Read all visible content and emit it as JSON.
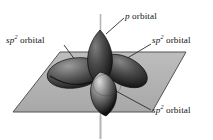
{
  "figure": {
    "background_color": "#ffffff",
    "plane": {
      "name": "trigonal plane",
      "fill_color": "#b3b3b3",
      "edge_color": "#4d4d4d"
    },
    "axis": {
      "name": "vertical axis",
      "color": "#b5b5b5"
    },
    "labels": {
      "p_orbital": {
        "prefix": "p",
        "suffix": " orbital"
      },
      "sp2_orbital_left": {
        "prefix": "sp",
        "sup": "2",
        "suffix": " orbital"
      },
      "sp2_orbital_right": {
        "prefix": "sp",
        "sup": "2",
        "suffix": " orbital"
      },
      "sp2_orbital_bottom": {
        "prefix": "sp",
        "sup": "2",
        "suffix": " orbital"
      }
    },
    "lobes": [
      {
        "name": "p-orbital-lobe-up",
        "type": "p",
        "direction": "up",
        "fill_dark": "#2a2a2a",
        "fill_light": "#6f6f6f"
      },
      {
        "name": "sp2-lobe-left",
        "type": "sp2",
        "direction": "left-back",
        "fill_dark": "#2e2e2e",
        "fill_light": "#8a8a8a"
      },
      {
        "name": "sp2-lobe-right",
        "type": "sp2",
        "direction": "right-back",
        "fill_dark": "#262626",
        "fill_light": "#777777"
      },
      {
        "name": "sp2-lobe-front",
        "type": "sp2",
        "direction": "front-down",
        "fill_dark": "#1f1f1f",
        "fill_light": "#c9c9c9"
      }
    ]
  }
}
